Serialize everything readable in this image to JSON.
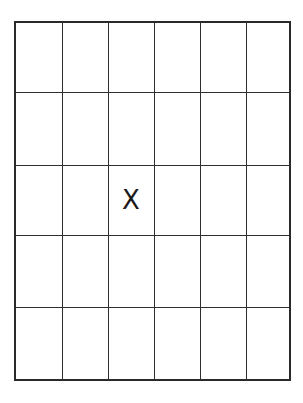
{
  "grid": {
    "rows": 5,
    "columns": 6,
    "line_color": "#2f2f2f",
    "border_color": "#2a2a2a",
    "background": "#ffffff"
  },
  "marks": [
    {
      "row": 3,
      "column": 3,
      "label": "X"
    }
  ]
}
